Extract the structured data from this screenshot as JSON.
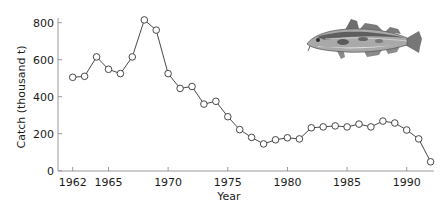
{
  "chart_data": {
    "type": "line",
    "title": "",
    "xlabel": "Year",
    "ylabel": "Catch (thousand t)",
    "x": [
      1962,
      1963,
      1964,
      1965,
      1966,
      1967,
      1968,
      1969,
      1970,
      1971,
      1972,
      1973,
      1974,
      1975,
      1976,
      1977,
      1978,
      1979,
      1980,
      1981,
      1982,
      1983,
      1984,
      1985,
      1986,
      1987,
      1988,
      1989,
      1990,
      1991,
      1992
    ],
    "series": [
      {
        "name": "Cod catch",
        "values": [
          505,
          510,
          615,
          548,
          525,
          615,
          815,
          760,
          525,
          445,
          455,
          360,
          375,
          292,
          222,
          180,
          145,
          167,
          178,
          172,
          232,
          237,
          242,
          237,
          252,
          237,
          268,
          258,
          220,
          172,
          48
        ]
      }
    ],
    "xticks": [
      1962,
      1965,
      1970,
      1975,
      1980,
      1985,
      1990
    ],
    "yticks": [
      0,
      200,
      400,
      600,
      800
    ],
    "xlim": [
      1962,
      1992
    ],
    "ylim": [
      0,
      870
    ],
    "grid": false,
    "legend": null,
    "marker": "open-circle",
    "annotations": [
      "cod fish illustration (top right)"
    ]
  },
  "colors": {
    "line": "#333333",
    "marker_fill": "#ffffff",
    "axis": "#9a9a9a",
    "text": "#1a1a1a"
  }
}
